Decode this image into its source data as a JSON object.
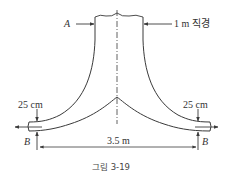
{
  "figure": {
    "caption": "그림 3-19",
    "labels": {
      "point_a": "A",
      "diameter": "1 m 직경",
      "left_gap": "25 cm",
      "right_gap": "25 cm",
      "left_b": "B",
      "right_b": "B",
      "span": "3.5 m"
    },
    "colors": {
      "stroke": "#3a3a3a",
      "text": "#333333",
      "background": "#ffffff"
    }
  }
}
